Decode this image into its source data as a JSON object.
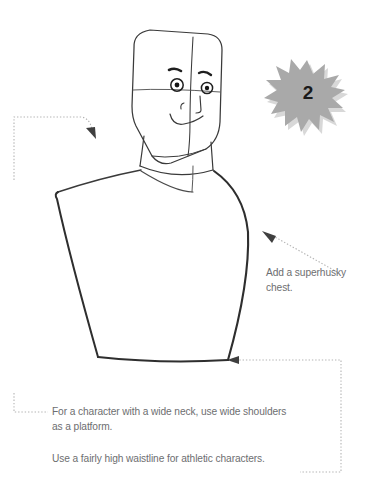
{
  "page": {
    "background_color": "#ffffff",
    "width": 372,
    "height": 493,
    "type": "drawing-tutorial-step"
  },
  "badge": {
    "step_number": "2",
    "shape": "starburst",
    "fill_color": "#a9a9a9",
    "shadow_color": "#d3d3d3",
    "text_color": "#1a1a1a"
  },
  "captions": {
    "chest": "Add a superhusky\nchest.",
    "shoulders": "For a character with a wide neck, use wide shoulders\nas a platform.",
    "waistline": "Use a fairly high waistline for athletic characters.",
    "text_color": "#6d6e70"
  },
  "illustration": {
    "subject": "male-head-and-torso-construction-sketch",
    "line_color": "#3a3a3a",
    "construction_line_color": "#6b6b6b",
    "parts": [
      "head-outline",
      "vertical-centerline",
      "horizontal-eyeline",
      "left-eye",
      "right-eye",
      "left-eyebrow",
      "right-eyebrow",
      "nose",
      "mouth",
      "jaw-line",
      "neck",
      "neck-base",
      "left-shoulder",
      "right-shoulder",
      "chest",
      "waistline"
    ]
  },
  "leaders": {
    "color": "#b0b0b0",
    "arrow_color": "#4a4a4a",
    "items": [
      {
        "name": "neck-leader",
        "target": "neck"
      },
      {
        "name": "chest-leader",
        "target": "chest"
      },
      {
        "name": "waistline-leader",
        "target": "waistline"
      }
    ]
  }
}
